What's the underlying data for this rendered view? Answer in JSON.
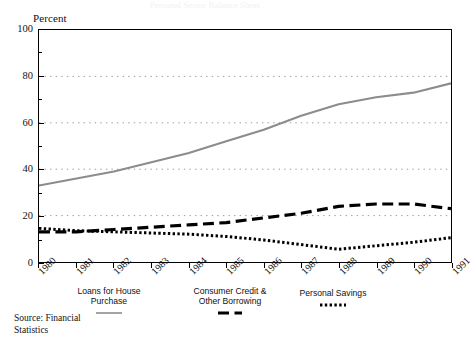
{
  "figure": {
    "ghost_title": "Personal Sector Balance Sheet",
    "y_axis_title": "Percent",
    "source_note": "Source: Financial\nStatistics"
  },
  "legend": [
    {
      "label_line1": "Loans for House",
      "label_line2": "Purchase",
      "style": "solid",
      "color": "#8c8c8c",
      "x": 70,
      "y": 287,
      "w": 78
    },
    {
      "label_line1": "Consumer Credit &",
      "label_line2": "Other Borrowing",
      "style": "dashed",
      "color": "#000000",
      "x": 188,
      "y": 287,
      "w": 84
    },
    {
      "label_line1": "Personal Savings",
      "label_line2": "",
      "style": "dotted",
      "color": "#000000",
      "x": 292,
      "y": 289,
      "w": 82
    }
  ],
  "chart_data": {
    "type": "line",
    "title": "",
    "xlabel": "",
    "ylabel": "Percent",
    "ylim": [
      0,
      100
    ],
    "yticks": [
      0,
      20,
      40,
      60,
      80,
      100
    ],
    "yticks_minor": [
      10,
      30,
      50,
      70,
      90
    ],
    "gridlines_y": [
      20,
      40,
      60,
      80
    ],
    "grid": "horizontal-dotted",
    "legend_position": "below-plot",
    "x": [
      1980,
      1981,
      1982,
      1983,
      1984,
      1985,
      1986,
      1987,
      1988,
      1989,
      1990,
      1991
    ],
    "categories": [
      "1980",
      "1981",
      "1982",
      "1983",
      "1984",
      "1985",
      "1986",
      "1987",
      "1988",
      "1989",
      "1990",
      "1991"
    ],
    "series": [
      {
        "name": "Loans for House Purchase",
        "style": "solid",
        "color": "#8c8c8c",
        "values": [
          33,
          36,
          39,
          43,
          47,
          52,
          57,
          63,
          68,
          71,
          73,
          77
        ]
      },
      {
        "name": "Consumer Credit & Other Borrowing",
        "style": "dashed",
        "color": "#000000",
        "values": [
          13,
          13,
          14,
          15,
          16,
          17,
          19,
          21,
          24,
          25,
          25,
          23
        ]
      },
      {
        "name": "Personal Savings",
        "style": "dotted",
        "color": "#000000",
        "values": [
          14.5,
          13.5,
          13,
          12.5,
          12,
          11,
          9.5,
          7.5,
          5.5,
          7,
          8.5,
          10.5
        ]
      }
    ]
  }
}
